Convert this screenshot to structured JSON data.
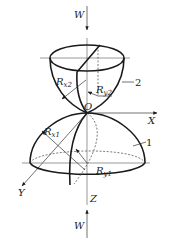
{
  "figure": {
    "colors": {
      "ink": "#1a1a1a",
      "background": "#ffffff"
    },
    "labels": {
      "load_top": "W",
      "load_bottom": "W",
      "origin": "O",
      "axis_x": "X",
      "axis_y": "Y",
      "axis_z": "Z",
      "body_upper": "2",
      "body_lower": "1",
      "rx2": {
        "main": "R",
        "sub": "x2"
      },
      "ry2": {
        "main": "R",
        "sub": "y2"
      },
      "rx1": {
        "main": "R",
        "sub": "x1"
      },
      "ry1": {
        "main": "R",
        "sub": "y1"
      }
    }
  }
}
